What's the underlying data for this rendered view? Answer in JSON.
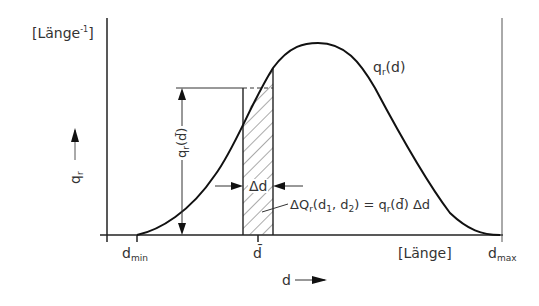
{
  "diagram": {
    "type": "frequency-distribution",
    "y_unit_label": "[Länge",
    "y_unit_exp": "-1",
    "y_unit_close": "]",
    "y_axis_var": "q",
    "y_axis_sub": "r",
    "x_axis_var": "d",
    "x_unit_label": "[Länge]",
    "curve_label": "q",
    "curve_label_sub": "r",
    "curve_label_arg": "(d)",
    "height_label": "q",
    "height_label_sub": "r",
    "height_label_arg": "(d̄)",
    "delta_d_label": "Δd",
    "area_formula_prefix": "ΔQ",
    "area_formula_sub": "r",
    "area_formula_args": "(d",
    "area_formula_d1": "1",
    "area_formula_sep": ", d",
    "area_formula_d2": "2",
    "area_formula_rest": ") = q",
    "area_formula_rest_sub": "r",
    "area_formula_end": "(d̄) Δd",
    "d_min_base": "d",
    "d_min_sub": "min",
    "d_bar": "d̄",
    "d_max_base": "d",
    "d_max_sub": "max"
  }
}
